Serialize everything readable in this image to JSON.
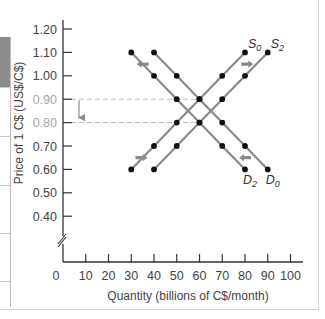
{
  "chart_data": {
    "type": "line",
    "title": "",
    "xlabel": "Quantity (billions of C$/month)",
    "ylabel": "Price of 1 C$ (US$/C$)",
    "x_ticks": [
      "0",
      "10",
      "20",
      "30",
      "40",
      "50",
      "60",
      "70",
      "80",
      "90",
      "100"
    ],
    "y_ticks": [
      "0.40",
      "0.50",
      "0.60",
      "0.70",
      "0.80",
      "0.90",
      "1.00",
      "1.10",
      "1.20"
    ],
    "xlim": [
      0,
      100
    ],
    "ylim": [
      0.4,
      1.2
    ],
    "y_axis_break": true,
    "grid": false,
    "legend": "inline labels at curve ends",
    "series": [
      {
        "name": "D0",
        "label_main": "D",
        "label_sub": "0",
        "kind": "demand",
        "x": [
          40,
          50,
          60,
          70,
          80,
          90
        ],
        "y": [
          1.1,
          1.0,
          0.9,
          0.8,
          0.7,
          0.6
        ]
      },
      {
        "name": "D2",
        "label_main": "D",
        "label_sub": "2",
        "kind": "demand",
        "x": [
          30,
          40,
          50,
          60,
          70,
          80
        ],
        "y": [
          1.1,
          1.0,
          0.9,
          0.8,
          0.7,
          0.6
        ]
      },
      {
        "name": "S0",
        "label_main": "S",
        "label_sub": "0",
        "kind": "supply",
        "x": [
          30,
          40,
          50,
          60,
          70,
          80
        ],
        "y": [
          0.6,
          0.7,
          0.8,
          0.9,
          1.0,
          1.1
        ]
      },
      {
        "name": "S2",
        "label_main": "S",
        "label_sub": "2",
        "kind": "supply",
        "x": [
          40,
          50,
          60,
          70,
          80,
          90
        ],
        "y": [
          0.6,
          0.7,
          0.8,
          0.9,
          1.0,
          1.1
        ]
      }
    ],
    "annotations": [
      {
        "type": "dashed-line",
        "y": 0.9,
        "from_x": 0,
        "to_x": 60,
        "label": "0.90"
      },
      {
        "type": "dashed-line",
        "y": 0.8,
        "from_x": 0,
        "to_x": 60,
        "label": "0.80"
      },
      {
        "type": "arrow",
        "direction": "down",
        "from_y": 0.9,
        "to_y": 0.8,
        "note": "equilibrium price falls"
      },
      {
        "type": "shift-arrow",
        "direction": "left",
        "curve": "D",
        "at": "top"
      },
      {
        "type": "shift-arrow",
        "direction": "left",
        "curve": "D",
        "at": "bottom"
      },
      {
        "type": "shift-arrow",
        "direction": "right",
        "curve": "S",
        "at": "top"
      },
      {
        "type": "shift-arrow",
        "direction": "right",
        "curve": "S",
        "at": "bottom"
      }
    ],
    "equilibria": [
      {
        "name": "initial",
        "x": 60,
        "y": 0.9
      },
      {
        "name": "new",
        "x": 60,
        "y": 0.8
      }
    ]
  },
  "colors": {
    "axis": "#333333",
    "curve": "#8a8a8a",
    "point": "#111111",
    "arrow": "#8a8a8a",
    "dashed": "#bdbdbd",
    "muted_label": "#a6a6a6"
  }
}
